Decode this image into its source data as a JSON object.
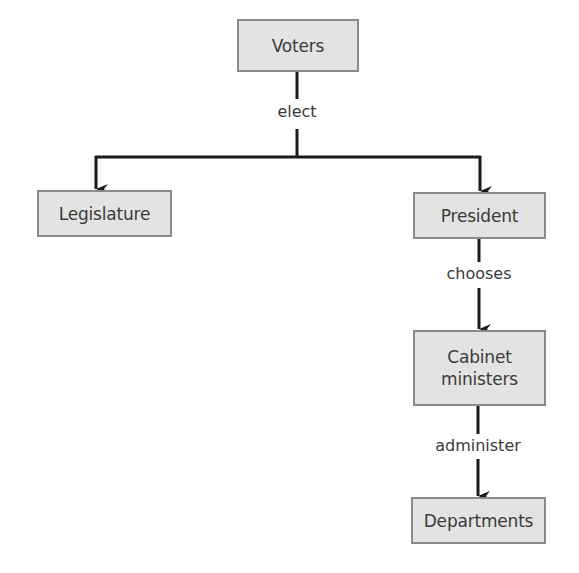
{
  "diagram": {
    "type": "flowchart",
    "nodes": {
      "voters": {
        "label": "Voters"
      },
      "legislature": {
        "label": "Legislature"
      },
      "president": {
        "label": "President"
      },
      "cabinet": {
        "label": "Cabinet ministers",
        "line1": "Cabinet",
        "line2": "ministers"
      },
      "departments": {
        "label": "Departments"
      }
    },
    "edges": {
      "elect": {
        "label": "elect",
        "from": "Voters",
        "to": [
          "Legislature",
          "President"
        ]
      },
      "chooses": {
        "label": "chooses",
        "from": "President",
        "to": "Cabinet ministers"
      },
      "administer": {
        "label": "administer",
        "from": "Cabinet ministers",
        "to": "Departments"
      }
    },
    "colors": {
      "box_fill": "#e3e3e3",
      "box_border": "#8a8a8a",
      "line": "#1a1a1a",
      "text": "#3a3a3a"
    }
  }
}
